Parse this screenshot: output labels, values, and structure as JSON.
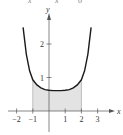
{
  "header_fragment": [
    "x",
    "x",
    "6"
  ],
  "chart_data": {
    "type": "area",
    "title": "",
    "xlabel": "x",
    "ylabel": "y",
    "x_ticks": [
      -2,
      -1,
      1,
      2,
      3
    ],
    "y_ticks": [
      1,
      2
    ],
    "xlim": [
      -2.3,
      3.5
    ],
    "ylim": [
      -0.6,
      3.0
    ],
    "grid": false,
    "legend": null,
    "series": [
      {
        "name": "curve",
        "description": "U-shaped curve with minimum near x≈0.5, y≈0.6, rising steeply on both sides",
        "x": [
          -1.6,
          -1.4,
          -1.2,
          -1.0,
          -0.75,
          -0.5,
          -0.25,
          0.0,
          0.25,
          0.5,
          0.75,
          1.0,
          1.25,
          1.5,
          1.75,
          2.0,
          2.2,
          2.4,
          2.6
        ],
        "y": [
          2.5,
          1.7,
          1.2,
          0.93,
          0.78,
          0.69,
          0.64,
          0.62,
          0.61,
          0.61,
          0.61,
          0.62,
          0.64,
          0.69,
          0.78,
          0.93,
          1.2,
          1.7,
          2.5
        ]
      }
    ],
    "shaded_region": {
      "x_from": -1,
      "x_to": 2,
      "under": "curve",
      "color": "#e3e3e3"
    }
  },
  "labels": {
    "x_axis": "x",
    "y_axis": "y",
    "x_tick_labels": [
      "−2",
      "−1",
      "1",
      "2",
      "3"
    ],
    "y_tick_labels": [
      "1",
      "2"
    ]
  },
  "colors": {
    "curve": "#1a1a1a",
    "axis": "#555555",
    "shade": "#e3e3e3",
    "shade_edge": "#9a9a9a"
  }
}
